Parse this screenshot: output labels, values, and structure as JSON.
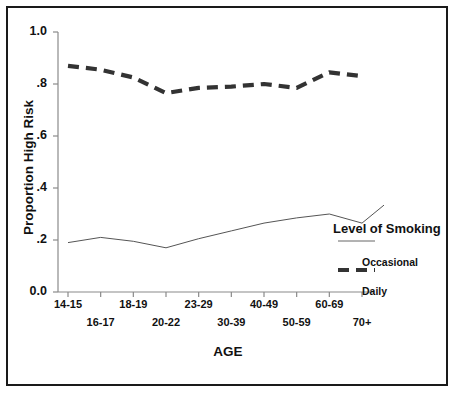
{
  "chart_data": {
    "type": "line",
    "title": "",
    "xlabel": "AGE",
    "ylabel": "Proportion High Risk",
    "ylim": [
      0.0,
      1.0
    ],
    "grid": false,
    "legend_position": "right-inside",
    "legend_title": "Level of Smoking",
    "categories": [
      "14-15",
      "16-17",
      "18-19",
      "20-22",
      "23-29",
      "30-39",
      "40-49",
      "50-59",
      "60-69",
      "70+"
    ],
    "y_ticks": [
      "0.0",
      ".2",
      ".4",
      ".6",
      ".8",
      "1.0"
    ],
    "y_tick_values": [
      0.0,
      0.2,
      0.4,
      0.6,
      0.8,
      1.0
    ],
    "series": [
      {
        "name": "Daily",
        "style": "thick-dashed",
        "color": "#333333",
        "values": [
          0.87,
          0.855,
          0.825,
          0.765,
          0.785,
          0.79,
          0.8,
          0.785,
          0.845,
          0.83
        ]
      },
      {
        "name": "Occasional",
        "style": "thin-solid",
        "color": "#555555",
        "values": [
          0.19,
          0.21,
          0.195,
          0.17,
          0.205,
          0.235,
          0.265,
          0.285,
          0.3,
          0.265
        ]
      }
    ]
  },
  "axes": {
    "y_title": "Proportion High Risk",
    "x_title": "AGE",
    "y_ticks": [
      {
        "label": "1.0",
        "value": 1.0
      },
      {
        "label": ".8",
        "value": 0.8
      },
      {
        "label": ".6",
        "value": 0.6
      },
      {
        "label": ".4",
        "value": 0.4
      },
      {
        "label": ".2",
        "value": 0.2
      },
      {
        "label": "0.0",
        "value": 0.0
      }
    ],
    "x_ticks_row1": [
      "14-15",
      "18-19",
      "23-29",
      "40-49",
      "60-69"
    ],
    "x_ticks_row2": [
      "16-17",
      "20-22",
      "30-39",
      "50-59",
      "70+"
    ]
  },
  "legend": {
    "title": "Level of Smoking",
    "entries": [
      {
        "label": "Occasional",
        "style": "thin-solid"
      },
      {
        "label": "Daily",
        "style": "thick-dashed"
      }
    ]
  },
  "colors": {
    "frame": "#1a1a1a",
    "axis": "#808080",
    "daily_line": "#333333",
    "occasional_line": "#666666",
    "text": "#111111",
    "background": "#ffffff"
  }
}
